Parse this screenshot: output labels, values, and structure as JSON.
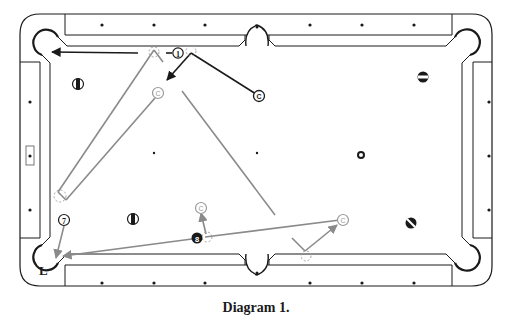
{
  "caption": "Diagram 1.",
  "colors": {
    "table_line": "#1a1a1a",
    "primary_path": "#1a1a1a",
    "secondary_path": "#8a8a8a",
    "ghost_ball": "#9a9a9a",
    "diamond": "#1a1a1a"
  },
  "pocket_label": "L",
  "balls": [
    {
      "id": "ball-1",
      "label": "1",
      "x": 178,
      "y": 53,
      "style": "numbered-white"
    },
    {
      "id": "ball-7",
      "label": "7",
      "x": 64,
      "y": 220,
      "style": "numbered-white"
    },
    {
      "id": "ball-8",
      "label": "8",
      "x": 197,
      "y": 238,
      "style": "solid-black"
    },
    {
      "id": "ball-stripe-left-top",
      "label": "",
      "x": 78,
      "y": 84,
      "style": "stripe-vertical"
    },
    {
      "id": "ball-stripe-left-bottom",
      "label": "",
      "x": 133,
      "y": 219,
      "style": "stripe-vertical"
    },
    {
      "id": "ball-stripe-right-top",
      "label": "",
      "x": 423,
      "y": 77,
      "style": "stripe-horizontal"
    },
    {
      "id": "ball-stripe-right-bottom",
      "label": "",
      "x": 411,
      "y": 223,
      "style": "stripe-diagonal"
    }
  ],
  "cue_balls": [
    {
      "id": "cue-start",
      "label": "C",
      "x": 259,
      "y": 96,
      "style": "dark"
    },
    {
      "id": "cue-pos-2",
      "label": "C",
      "x": 158,
      "y": 93,
      "style": "light"
    },
    {
      "id": "cue-pos-3",
      "label": "C",
      "x": 201,
      "y": 208,
      "style": "light"
    },
    {
      "id": "cue-pos-4",
      "label": "C",
      "x": 343,
      "y": 220,
      "style": "light"
    }
  ],
  "spots": [
    {
      "id": "foot-spot",
      "x": 361,
      "y": 155
    }
  ]
}
